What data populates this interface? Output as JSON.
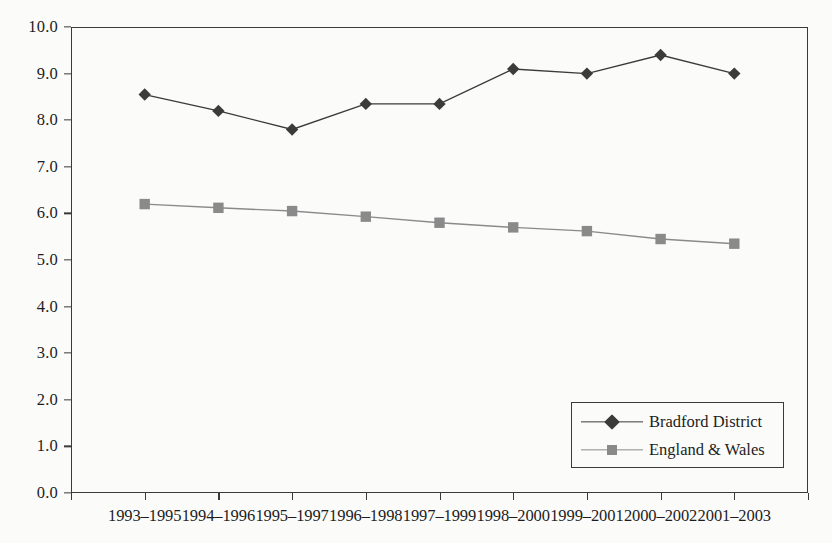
{
  "chart_data": {
    "type": "line",
    "title": "",
    "xlabel": "",
    "ylabel": "",
    "ylim": [
      0.0,
      10.0
    ],
    "ytick_step": 1.0,
    "grid": false,
    "legend_position": "bottom-right",
    "categories": [
      "1993–1995",
      "1994–1996",
      "1995–1997",
      "1996–1998",
      "1997–1999",
      "1998–2000",
      "1999–2001",
      "2000–2002",
      "2001–2003"
    ],
    "ytick_labels": [
      "0.0",
      "1.0",
      "2.0",
      "3.0",
      "4.0",
      "5.0",
      "6.0",
      "7.0",
      "8.0",
      "9.0",
      "10.0"
    ],
    "series": [
      {
        "name": "Bradford District",
        "marker": "diamond",
        "color": "#3b3b3b",
        "values": [
          8.55,
          8.2,
          7.8,
          8.35,
          8.35,
          9.1,
          9.0,
          9.4,
          9.0
        ]
      },
      {
        "name": "England & Wales",
        "marker": "square",
        "color": "#8a8a8a",
        "values": [
          6.2,
          6.12,
          6.05,
          5.93,
          5.8,
          5.7,
          5.62,
          5.45,
          5.35
        ]
      }
    ]
  },
  "legend": {
    "items": [
      {
        "label": "Bradford District"
      },
      {
        "label": "England & Wales"
      }
    ]
  },
  "colors": {
    "background": "#fbfbfa",
    "axis": "#3a3a3a",
    "text": "#1d1d1d",
    "series_bradford": "#3b3b3b",
    "series_england_wales": "#8a8a8a"
  }
}
